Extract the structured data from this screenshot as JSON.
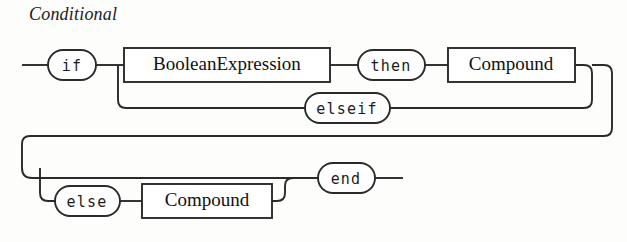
{
  "diagram": {
    "title": "Conditional",
    "type": "railroad-syntax-diagram",
    "nodes": {
      "if_keyword": "if",
      "boolean_expression": "BooleanExpression",
      "then_keyword": "then",
      "compound_then": "Compound",
      "elseif_keyword": "elseif",
      "else_keyword": "else",
      "compound_else": "Compound",
      "end_keyword": "end"
    },
    "colors": {
      "line": "#2a2a2a",
      "text": "#1c1c1c",
      "background": "#fdfdfc",
      "node_fill": "#ffffff"
    }
  }
}
